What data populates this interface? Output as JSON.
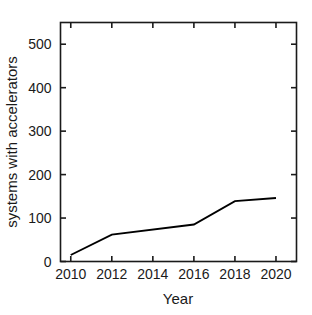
{
  "chart_data": {
    "type": "line",
    "title": "",
    "xlabel": "Year",
    "ylabel": "systems with accelerators",
    "xlim": [
      2009.5,
      2021.0
    ],
    "ylim": [
      0,
      550
    ],
    "grid": false,
    "legend": null,
    "xticks": [
      2010,
      2012,
      2014,
      2016,
      2018,
      2020
    ],
    "xtick_labels": [
      "2010",
      "2012",
      "2014",
      "2016",
      "2018",
      "2020"
    ],
    "yticks": [
      0,
      100,
      200,
      300,
      400,
      500
    ],
    "ytick_labels": [
      "0",
      "100",
      "200",
      "300",
      "400",
      "500"
    ],
    "x": [
      2010,
      2012,
      2016,
      2018,
      2020
    ],
    "values": [
      15,
      62,
      85,
      139,
      146
    ],
    "series": [
      {
        "name": "systems with accelerators",
        "color": "#000000",
        "x": [
          2010,
          2012,
          2016,
          2018,
          2020
        ],
        "values": [
          15,
          62,
          85,
          139,
          146
        ]
      }
    ]
  },
  "axes": {
    "x_title": "Year",
    "y_title": "systems with accelerators"
  },
  "style": {
    "line_color": "#000000",
    "axis_color": "#1a1a1a",
    "background": "#ffffff"
  }
}
